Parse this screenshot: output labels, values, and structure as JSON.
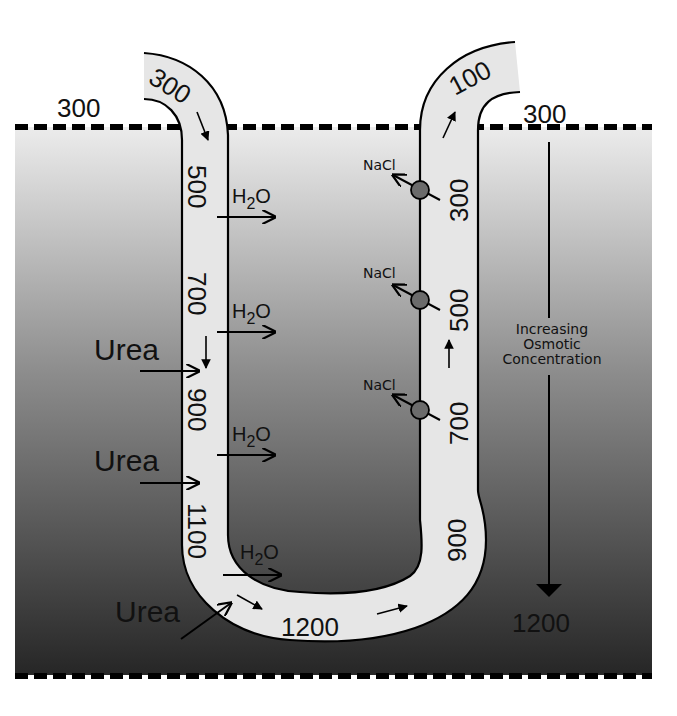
{
  "diagram": {
    "colors": {
      "background_top": "#ececec",
      "background_bottom": "#262626",
      "tube_fill": "#e6e6e6",
      "outline": "#000000",
      "pump_fill": "#6b6b6b",
      "dash": "#000000"
    },
    "interstitium": {
      "top_value": "300",
      "bottom_value": "1200",
      "gradient_label_line1": "Increasing",
      "gradient_label_line2": "Osmotic",
      "gradient_label_line3": "Concentration"
    },
    "descending_limb": {
      "entry_value": "300",
      "values": [
        "500",
        "700",
        "900",
        "1100"
      ],
      "water_label": "H",
      "water_sub": "2",
      "water_label_end": "O"
    },
    "loop_bottom": {
      "value": "1200"
    },
    "ascending_limb": {
      "values": [
        "900",
        "700",
        "500",
        "300"
      ],
      "exit_value": "100",
      "salt_label": "NaCl"
    },
    "urea": {
      "label": "Urea"
    },
    "outside_left_value": "300"
  }
}
